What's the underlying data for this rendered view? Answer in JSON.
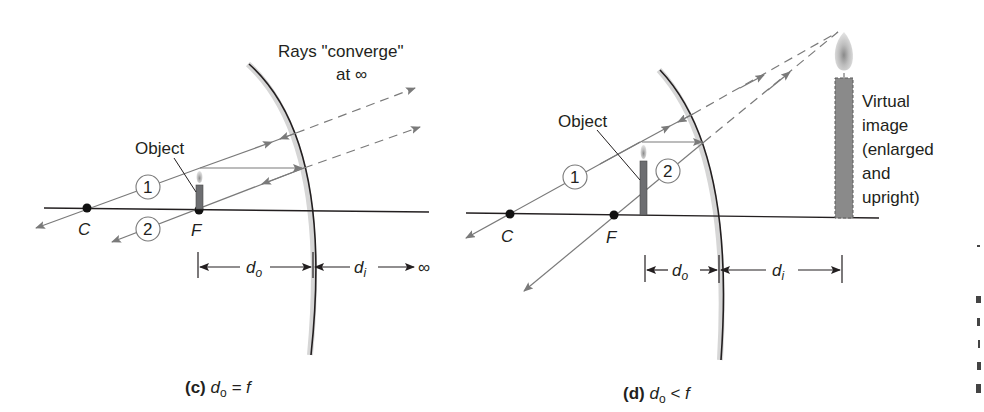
{
  "panel_c": {
    "caption_letter": "(c)",
    "caption_expr_d": "d",
    "caption_expr_sub": "o",
    "caption_expr_rest": " = f",
    "rays_label_line1": "Rays \"converge\"",
    "rays_label_line2": "at ∞",
    "object_label": "Object",
    "point_c": "C",
    "point_f": "F",
    "ray_1": "1",
    "ray_2": "2",
    "do_label": "d",
    "do_sub": "o",
    "di_label": "d",
    "di_sub": "i",
    "infinity": "∞"
  },
  "panel_d": {
    "caption_letter": "(d)",
    "caption_expr_d": "d",
    "caption_expr_sub": "o",
    "caption_expr_rest": " < f",
    "object_label": "Object",
    "point_c": "C",
    "point_f": "F",
    "ray_1": "1",
    "ray_2": "2",
    "do_label": "d",
    "do_sub": "o",
    "di_label": "d",
    "di_sub": "i",
    "image_label_lines": [
      "Virtual",
      "image",
      "(enlarged",
      "and",
      "upright)"
    ]
  },
  "colors": {
    "axis": "#231f20",
    "ray": "#7a7a7a",
    "candle": "#6d6e71",
    "mirror_shade": "#d0d0d0"
  }
}
